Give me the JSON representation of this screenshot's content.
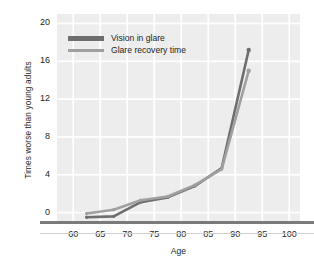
{
  "chart_data": {
    "type": "line",
    "title": "",
    "xlabel": "Age",
    "ylabel": "Times worse than young adults",
    "xlim": [
      57,
      102
    ],
    "ylim": [
      -1,
      21
    ],
    "xticks": [
      60,
      65,
      70,
      75,
      80,
      85,
      90,
      95,
      100
    ],
    "yticks": [
      0,
      4,
      8,
      12,
      16,
      20
    ],
    "grid": true,
    "legend_position": "top-left-inside",
    "x": [
      62.5,
      67.5,
      72.5,
      77.5,
      82.5,
      87.5,
      92.5
    ],
    "series": [
      {
        "name": "Vision in glare",
        "color": "#6e6e6e",
        "values": [
          -0.5,
          -0.4,
          1.1,
          1.6,
          2.8,
          4.7,
          17.2
        ]
      },
      {
        "name": "Glare recovery time",
        "color": "#a0a0a0",
        "values": [
          -0.1,
          0.3,
          1.3,
          1.7,
          2.9,
          4.6,
          15.0
        ]
      }
    ]
  },
  "legend": {
    "items": [
      {
        "label": "Vision in glare",
        "color": "#6e6e6e"
      },
      {
        "label": "Glare recovery time",
        "color": "#a0a0a0"
      }
    ]
  },
  "axes": {
    "x_title": "Age",
    "y_title": "Times worse than young adults",
    "x_tick_labels": [
      "60",
      "65",
      "70",
      "75",
      "80",
      "85",
      "90",
      "95",
      "100"
    ],
    "y_tick_labels": [
      "0",
      "4",
      "8",
      "12",
      "16",
      "20"
    ]
  },
  "colors": {
    "plot_background": "#ededed",
    "grid": "#ffffff",
    "baseline": "#7a7a7a",
    "text": "#231f20",
    "series_dark": "#6e6e6e",
    "series_light": "#a0a0a0"
  }
}
